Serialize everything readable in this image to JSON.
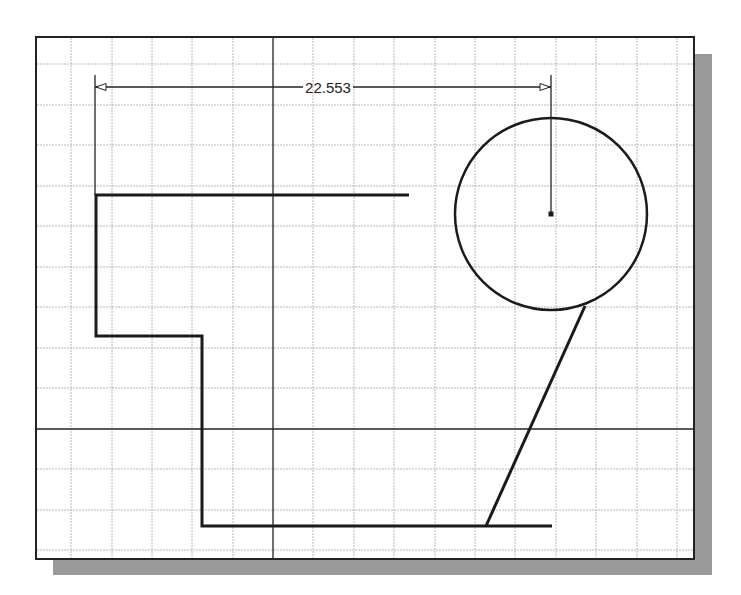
{
  "sketch": {
    "frame": {
      "x": 36,
      "y": 37,
      "width": 658,
      "height": 522,
      "border_color": "#222222",
      "shadow_color": "#9a9a9a"
    },
    "grid": {
      "spacing": 40.4,
      "color": "#b8b8b8",
      "origin_x": 273,
      "origin_y": 429
    },
    "axes": {
      "vertical_x": 273,
      "horizontal_y": 429,
      "color": "#222222"
    },
    "dimension": {
      "value": "22.553",
      "line_y": 87,
      "x1": 95,
      "x2": 551
    },
    "profile": {
      "polyline": [
        [
          409,
          195
        ],
        [
          96,
          195
        ],
        [
          96,
          336
        ],
        [
          202,
          336
        ],
        [
          202,
          526
        ],
        [
          552,
          526
        ]
      ],
      "diagonal": {
        "x1": 486,
        "y1": 526,
        "x2": 585,
        "y2": 306
      }
    },
    "circle": {
      "cx": 551,
      "cy": 214,
      "r": 96
    }
  }
}
